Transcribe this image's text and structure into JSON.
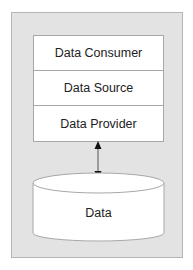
{
  "diagram": {
    "layers": [
      {
        "label": "Data Consumer"
      },
      {
        "label": "Data Source"
      },
      {
        "label": "Data Provider"
      }
    ],
    "store": {
      "label": "Data",
      "shape": "cylinder"
    },
    "connector": {
      "type": "bidirectional-arrow",
      "from": "Data Provider",
      "to": "Data"
    },
    "colors": {
      "background_panel": "#e3e3e3",
      "box_fill": "#ffffff",
      "border": "#a8a8a8",
      "text": "#222222"
    }
  }
}
